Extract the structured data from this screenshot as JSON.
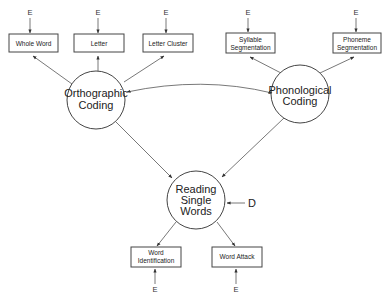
{
  "diagram": {
    "top_boxes": [
      {
        "id": "whole-word",
        "lines": [
          "Whole Word"
        ],
        "error": "E"
      },
      {
        "id": "letter",
        "lines": [
          "Letter"
        ],
        "error": "E"
      },
      {
        "id": "letter-cluster",
        "lines": [
          "Letter Cluster"
        ],
        "error": "E"
      },
      {
        "id": "syllable-segmentation",
        "lines": [
          "Syllable",
          "Segmentation"
        ],
        "error": "E"
      },
      {
        "id": "phoneme-segmentation",
        "lines": [
          "Phoneme",
          "Segmentation"
        ],
        "error": "E"
      }
    ],
    "factors": {
      "orthographic": {
        "lines": [
          "Orthographic",
          "Coding"
        ]
      },
      "phonological": {
        "lines": [
          "Phonological",
          "Coding"
        ]
      },
      "reading": {
        "lines": [
          "Reading",
          "Single",
          "Words"
        ],
        "disturbance": "D"
      }
    },
    "bottom_boxes": [
      {
        "id": "word-identification",
        "lines": [
          "Word",
          "Identification"
        ],
        "error": "E"
      },
      {
        "id": "word-attack",
        "lines": [
          "Word Attack"
        ],
        "error": "E"
      }
    ],
    "colors": {
      "line": "#555555",
      "border": "#444444",
      "text": "#222222",
      "background": "#ffffff"
    }
  }
}
